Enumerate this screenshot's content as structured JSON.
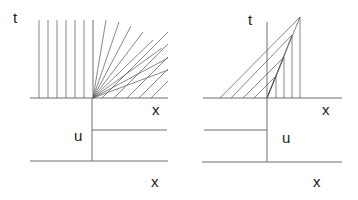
{
  "left_panel": {
    "name": "rarefaction",
    "labels": {
      "t": "t",
      "x_top": "x",
      "u": "u",
      "x_bottom": "x"
    },
    "vertical_characteristics": 7,
    "fan_characteristics": 8,
    "parallel_slanted_characteristics": 6,
    "initial_data": "step up: low for x<0, high for x>0"
  },
  "right_panel": {
    "name": "compression",
    "labels": {
      "t": "t",
      "x_top": "x",
      "u": "u",
      "x_bottom": "x"
    },
    "crossing_pairs": 4,
    "initial_data": "step down: high for x<0, low for x>0"
  },
  "colors": {
    "line": "#555555",
    "axis": "#6e6e6e",
    "text": "#222222",
    "background": "#ffffff"
  }
}
